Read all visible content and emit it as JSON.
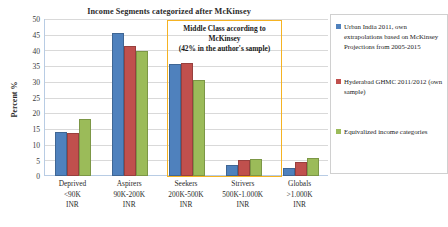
{
  "chart_data": {
    "type": "bar",
    "title": "Income Segments categorized after McKinsey",
    "xlabel": "",
    "ylabel": "Percent %",
    "ylim": [
      0,
      50
    ],
    "ytick_step": 5,
    "yticks": [
      "50",
      "45",
      "40",
      "35",
      "30",
      "25",
      "20",
      "15",
      "10",
      "5",
      "0"
    ],
    "grid": true,
    "legend_position": "right",
    "categories": [
      {
        "name": "Deprived",
        "range": "<90K",
        "unit": "INR"
      },
      {
        "name": "Aspirers",
        "range": "90K-200K",
        "unit": "INR"
      },
      {
        "name": "Seekers",
        "range": "200K-500K",
        "unit": "INR"
      },
      {
        "name": "Strivers",
        "range": "500K-1.000K",
        "unit": "INR"
      },
      {
        "name": "Globals",
        "range": ">1.000K",
        "unit": "INR"
      }
    ],
    "series": [
      {
        "name": "Urban India 2011, own extrapolations based on McKinsey Projections from 2005-2015",
        "color": "#4F81BD",
        "values": [
          14.0,
          45.8,
          36.0,
          3.4,
          2.7
        ]
      },
      {
        "name": "Hyderabad GHMC 2011/2012 (own sample)",
        "color": "#C0504D",
        "values": [
          13.7,
          41.7,
          36.1,
          5.2,
          4.6
        ]
      },
      {
        "name": "Equivalized income categories",
        "color": "#9BBB59",
        "values": [
          18.3,
          40.0,
          30.8,
          5.5,
          5.8
        ]
      }
    ],
    "annotations": [
      {
        "id": "middle-class-box",
        "line1": "Middle Class according to",
        "line2": "McKinsey",
        "line3": "(42% in the author's sample)",
        "color": "#F5B323",
        "covers": [
          "Seekers"
        ]
      }
    ]
  }
}
